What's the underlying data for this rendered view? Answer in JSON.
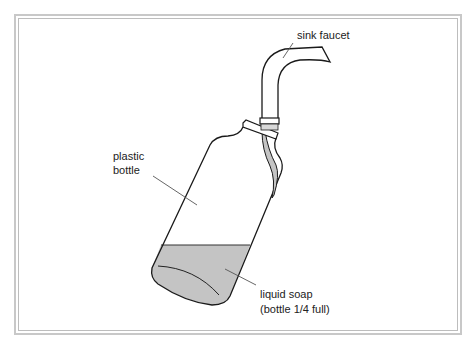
{
  "diagram": {
    "labels": {
      "faucet": "sink faucet",
      "bottle_line1": "plastic",
      "bottle_line2": "bottle",
      "soap_line1": "liquid soap",
      "soap_line2": "(bottle 1/4 full)"
    },
    "colors": {
      "outline": "#1a1a1a",
      "soap_fill": "#c4c4c4",
      "leader": "#555555",
      "frame": "#c8c8c8"
    },
    "soap_fill_fraction": 0.25
  }
}
